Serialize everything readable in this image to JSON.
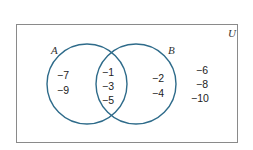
{
  "diagram": {
    "type": "venn",
    "universe": {
      "label": "U"
    },
    "sets": [
      {
        "label": "A"
      },
      {
        "label": "B"
      }
    ],
    "regions": {
      "a_only": [
        "−7",
        "−9"
      ],
      "a_and_b": [
        "−1",
        "−3",
        "−5"
      ],
      "b_only": [
        "−2",
        "−4"
      ],
      "outside": [
        "−6",
        "−8",
        "−10"
      ]
    },
    "colors": {
      "circle_stroke": "#2e6b8a",
      "border": "#8a8a8a",
      "text": "#222222"
    }
  }
}
